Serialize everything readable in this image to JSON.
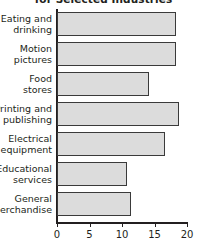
{
  "chart_data": {
    "type": "bar",
    "orientation": "horizontal",
    "title": "for Selected Industries",
    "xlabel": "",
    "ylabel": "",
    "xlim": [
      0,
      20
    ],
    "xticks": [
      0,
      5,
      10,
      15,
      20
    ],
    "grid": false,
    "legend": null,
    "categories": [
      "Eating and drinking",
      "Motion pictures",
      "Food stores",
      "Printing and publishing",
      "Electrical equipment",
      "Educational services",
      "General merchandise"
    ],
    "values": [
      18.3,
      18.3,
      14.1,
      18.8,
      16.6,
      10.7,
      11.4
    ],
    "bars": [
      {
        "label_line1": "Eating and",
        "label_line2": "drinking",
        "value": 18.3
      },
      {
        "label_line1": "Motion",
        "label_line2": "pictures",
        "value": 18.3
      },
      {
        "label_line1": "Food",
        "label_line2": "stores",
        "value": 14.1
      },
      {
        "label_line1": "Printing and",
        "label_line2": "publishing",
        "value": 18.8
      },
      {
        "label_line1": "Electrical",
        "label_line2": "equipment",
        "value": 16.6
      },
      {
        "label_line1": "Educational",
        "label_line2": "services",
        "value": 10.7
      },
      {
        "label_line1": "General",
        "label_line2": "merchandise",
        "value": 11.4
      }
    ],
    "tick_labels": [
      "0",
      "5",
      "10",
      "15",
      "20"
    ],
    "colors": {
      "bar_fill": "#dcdcdc",
      "bar_stroke": "#3a3a3a",
      "axis": "#231f20",
      "text": "#231f20",
      "background": "#ffffff"
    }
  }
}
